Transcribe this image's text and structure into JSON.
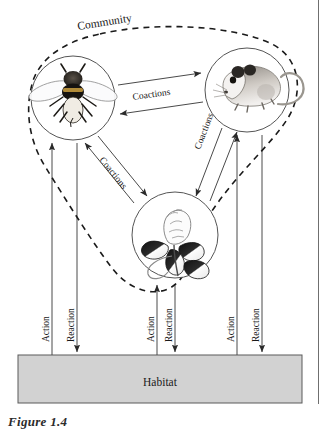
{
  "figure": {
    "caption": "Figure 1.4",
    "community_label": "Community",
    "habitat_label": "Habitat"
  },
  "nodes": [
    {
      "id": "bee",
      "icon": "bee-illustration",
      "cx": 73,
      "cy": 98,
      "r": 42
    },
    {
      "id": "mouse",
      "icon": "mouse-illustration",
      "cx": 247,
      "cy": 90,
      "r": 42
    },
    {
      "id": "flower",
      "icon": "clover-flower-illustration",
      "cx": 175,
      "cy": 235,
      "r": 43
    }
  ],
  "coactions": [
    {
      "id": "bee-mouse",
      "label": "Coactions"
    },
    {
      "id": "bee-flower",
      "label": "Coactions"
    },
    {
      "id": "mouse-flower",
      "label": "Coactions"
    }
  ],
  "habitat_links": [
    {
      "id": "bee",
      "action_label": "Action",
      "reaction_label": "Reaction"
    },
    {
      "id": "flower",
      "action_label": "Action",
      "reaction_label": "Reaction"
    },
    {
      "id": "mouse",
      "action_label": "Action",
      "reaction_label": "Reaction"
    }
  ],
  "colors": {
    "habitat_fill": "#d2d2d2",
    "line": "#4a4a4a",
    "boundary": "#1a1a1a",
    "text": "#1a1a1a"
  }
}
